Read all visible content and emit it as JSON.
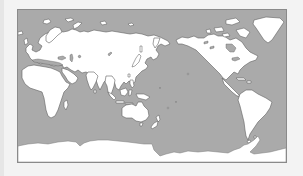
{
  "map": {
    "type": "world-map",
    "projection": "equirectangular",
    "center_longitude": "Pacific-centered",
    "colors": {
      "ocean": "#aaaaaa",
      "land": "#ffffff",
      "coastline": "#5f5f5f",
      "frame_border": "#8a8a8a",
      "page_background": "#f3f3f3"
    },
    "regions": [
      {
        "name": "Europe"
      },
      {
        "name": "Africa"
      },
      {
        "name": "Asia"
      },
      {
        "name": "Indonesia"
      },
      {
        "name": "Australia"
      },
      {
        "name": "New Zealand"
      },
      {
        "name": "North America"
      },
      {
        "name": "Greenland"
      },
      {
        "name": "Central America"
      },
      {
        "name": "South America"
      },
      {
        "name": "Antarctica"
      }
    ]
  }
}
